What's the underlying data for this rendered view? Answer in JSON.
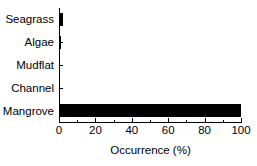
{
  "chart_data": {
    "type": "bar",
    "orientation": "horizontal",
    "title": "",
    "xlabel": "Occurrence (%)",
    "ylabel": "",
    "categories": [
      "Seagrass",
      "Algae",
      "Mudflat",
      "Channel",
      "Mangrove"
    ],
    "values": [
      2,
      1,
      0,
      0,
      100
    ],
    "series": [
      {
        "name": "Occurrence",
        "values": [
          2,
          1,
          0,
          0,
          100
        ]
      }
    ],
    "xlim": [
      0,
      100
    ],
    "xticks": [
      0,
      20,
      40,
      60,
      80,
      100
    ],
    "xtick_labels": [
      "0",
      "20",
      "40",
      "60",
      "80",
      "100"
    ],
    "xminor_ticks": [
      10,
      30,
      50,
      70,
      90
    ],
    "grid": false,
    "legend": false,
    "bar_color": "#000000",
    "background_color": "#ffffff",
    "axis_color": "#000000"
  }
}
